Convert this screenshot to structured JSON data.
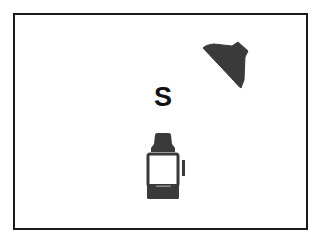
{
  "diagram": {
    "center_label": "S",
    "elements": [
      {
        "name": "center-label",
        "text": "S"
      },
      {
        "name": "dark-wedge-shape",
        "icon": "wedge-shape-icon"
      },
      {
        "name": "jar",
        "icon": "jar-icon"
      }
    ]
  },
  "colors": {
    "ink": "#333333",
    "border": "#1a1a1a",
    "background": "#ffffff"
  }
}
